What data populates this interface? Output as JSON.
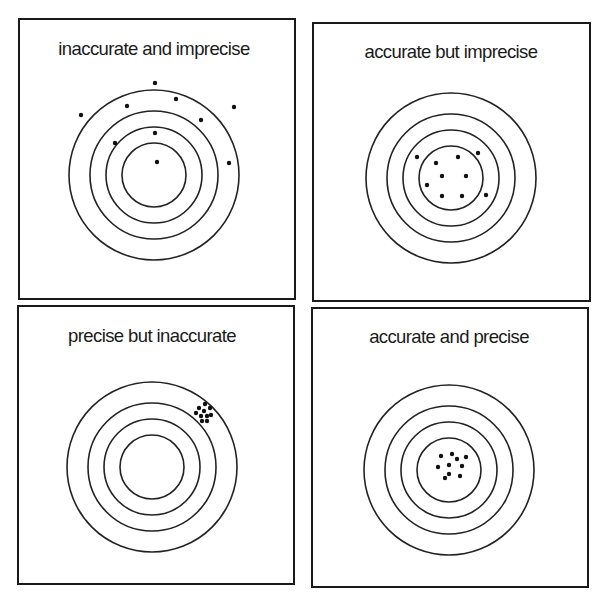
{
  "figure": {
    "colors": {
      "line": "#1a1a1a",
      "ring": "#222222",
      "dot": "#111111",
      "background": "#ffffff"
    },
    "ring_radii": [
      85,
      64,
      48,
      32
    ],
    "dot_radius": 2.2,
    "panels": [
      {
        "id": "inaccurate-imprecise",
        "title": "inaccurate and imprecise",
        "box": {
          "x": 18,
          "y": 18,
          "w": 278,
          "h": 282
        },
        "title_top": 38,
        "center": {
          "x": 154,
          "y": 175
        },
        "hits": [
          [
            155,
            83
          ],
          [
            176,
            99
          ],
          [
            127,
            106
          ],
          [
            234,
            107
          ],
          [
            81,
            115
          ],
          [
            201,
            120
          ],
          [
            155,
            133
          ],
          [
            115,
            143
          ],
          [
            157,
            162
          ],
          [
            229,
            163
          ]
        ]
      },
      {
        "id": "accurate-imprecise",
        "title": "accurate but imprecise",
        "box": {
          "x": 312,
          "y": 22,
          "w": 279,
          "h": 280
        },
        "title_top": 41,
        "center": {
          "x": 451,
          "y": 178
        },
        "hits": [
          [
            417,
            157
          ],
          [
            458,
            157
          ],
          [
            478,
            153
          ],
          [
            436,
            163
          ],
          [
            442,
            176
          ],
          [
            466,
            176
          ],
          [
            427,
            185
          ],
          [
            442,
            196
          ],
          [
            462,
            196
          ],
          [
            486,
            195
          ]
        ]
      },
      {
        "id": "precise-inaccurate",
        "title": "precise but inaccurate",
        "box": {
          "x": 17,
          "y": 305,
          "w": 278,
          "h": 280
        },
        "title_top": 325,
        "center": {
          "x": 152,
          "y": 467
        },
        "hits": [
          [
            205,
            404
          ],
          [
            199,
            408
          ],
          [
            210,
            408
          ],
          [
            204,
            411
          ],
          [
            196,
            413
          ],
          [
            201,
            416
          ],
          [
            207,
            416
          ],
          [
            211,
            415
          ],
          [
            202,
            421
          ],
          [
            207,
            421
          ]
        ]
      },
      {
        "id": "accurate-precise",
        "title": "accurate and precise",
        "box": {
          "x": 311,
          "y": 307,
          "w": 278,
          "h": 281
        },
        "title_top": 326,
        "center": {
          "x": 449,
          "y": 470
        },
        "hits": [
          [
            441,
            456
          ],
          [
            452,
            454
          ],
          [
            457,
            459
          ],
          [
            466,
            457
          ],
          [
            438,
            467
          ],
          [
            449,
            465
          ],
          [
            462,
            466
          ],
          [
            445,
            478
          ],
          [
            449,
            474
          ],
          [
            460,
            476
          ]
        ]
      }
    ]
  }
}
